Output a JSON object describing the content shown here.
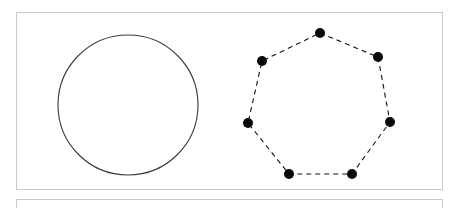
{
  "page": {
    "background_color": "#ffffff",
    "width": 458,
    "height": 208
  },
  "panel_main": {
    "name": "figure-panel",
    "border_color": "#c9c9c9",
    "background_color": "#ffffff",
    "x": 16,
    "y": 12,
    "width": 427,
    "height": 178
  },
  "panel_secondary": {
    "name": "next-panel-top-edge",
    "border_color": "#c9c9c9",
    "background_color": "#ffffff",
    "x": 16,
    "y": 199,
    "width": 427,
    "height": 40
  },
  "chart_data": {
    "type": "scatter",
    "title": "",
    "subtitle": "",
    "xlabel": "",
    "ylabel": "",
    "grid": false,
    "legend": "none",
    "axis_visible": false,
    "shapes": [
      {
        "name": "circle",
        "kind": "circle",
        "stroke_color": "#3a3a3a",
        "stroke_width": 1.1,
        "fill": "none",
        "dashed": false,
        "center": [
          128,
          105
        ],
        "radius": 70
      },
      {
        "name": "heptagon",
        "kind": "polygon",
        "sides": 7,
        "stroke_color": "#111111",
        "stroke_width": 1.1,
        "fill": "none",
        "dashed": true,
        "dash_pattern": "5 4",
        "vertex_marker": {
          "shape": "circle",
          "fill_color": "#0a0a0a",
          "radius": 5
        },
        "vertices": [
          [
            320,
            33
          ],
          [
            378,
            57
          ],
          [
            390,
            122
          ],
          [
            352,
            174
          ],
          [
            289,
            174
          ],
          [
            248,
            123
          ],
          [
            262,
            61
          ]
        ]
      }
    ]
  }
}
